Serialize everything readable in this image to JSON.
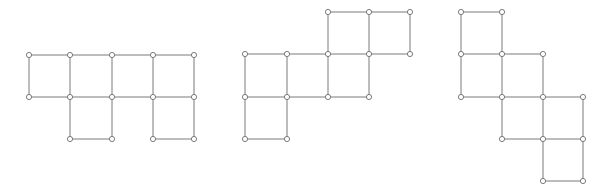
{
  "diagram": {
    "title": "",
    "colors": {
      "edge": "#7a7a7a",
      "node_stroke": "#6e6e6e",
      "node_fill": "#ffffff",
      "background": "#ffffff"
    },
    "node_radius": 2.6,
    "figures": [
      {
        "name": "net-1",
        "cells": [
          [
            29,
            55,
            70,
            97
          ],
          [
            70,
            55,
            112,
            97
          ],
          [
            112,
            55,
            153,
            97
          ],
          [
            153,
            55,
            194,
            97
          ],
          [
            70,
            97,
            112,
            139
          ],
          [
            153,
            97,
            194,
            139
          ]
        ]
      },
      {
        "name": "net-2",
        "cells": [
          [
            328,
            12,
            369,
            54
          ],
          [
            369,
            12,
            410,
            54
          ],
          [
            245,
            54,
            287,
            97
          ],
          [
            287,
            54,
            328,
            97
          ],
          [
            328,
            54,
            369,
            97
          ],
          [
            245,
            97,
            287,
            139
          ]
        ]
      },
      {
        "name": "net-3",
        "cells": [
          [
            461,
            12,
            502,
            54
          ],
          [
            461,
            54,
            502,
            97
          ],
          [
            502,
            54,
            543,
            97
          ],
          [
            502,
            97,
            543,
            139
          ],
          [
            543,
            97,
            583,
            139
          ],
          [
            543,
            139,
            583,
            181
          ]
        ]
      }
    ]
  }
}
